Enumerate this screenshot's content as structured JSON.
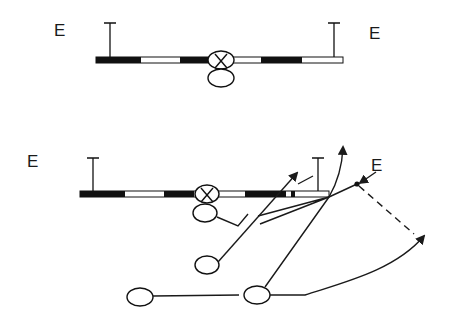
{
  "diagram": {
    "title": "",
    "formation_top": {
      "labels": [
        {
          "text": "E",
          "x": 54,
          "y": 24
        },
        {
          "text": "E",
          "x": 369,
          "y": 26
        }
      ],
      "line": {
        "x1": 96,
        "x2": 343,
        "y": 57,
        "h": 6,
        "segments": [
          {
            "fill": "#111111",
            "x": 96,
            "w": 45
          },
          {
            "fill": "#ffffff",
            "x": 141,
            "w": 39
          },
          {
            "fill": "#111111",
            "x": 180,
            "w": 30
          },
          {
            "fill": "#ffffff",
            "x": 235,
            "w": 26
          },
          {
            "fill": "#111111",
            "x": 261,
            "w": 41
          },
          {
            "fill": "#ffffff",
            "x": 302,
            "w": 41
          }
        ]
      },
      "tackles": [
        {
          "x": 110,
          "y_top": 23
        },
        {
          "x": 334,
          "y_top": 23
        }
      ],
      "center": {
        "label": "X",
        "cx": 221,
        "cy": 60,
        "rx": 13,
        "ry": 9
      },
      "qb": {
        "cx": 221,
        "cy": 78,
        "rx": 13,
        "ry": 9
      }
    },
    "formation_bottom": {
      "labels": [
        {
          "text": "E",
          "x": 27,
          "y": 154
        },
        {
          "text": "E",
          "x": 371,
          "y": 159
        }
      ],
      "line": {
        "x1": 80,
        "x2": 329,
        "y": 191,
        "h": 6,
        "segments": [
          {
            "fill": "#111111",
            "x": 80,
            "w": 45
          },
          {
            "fill": "#ffffff",
            "x": 125,
            "w": 39
          },
          {
            "fill": "#111111",
            "x": 164,
            "w": 30
          },
          {
            "fill": "#ffffff",
            "x": 219,
            "w": 26
          },
          {
            "fill": "#111111",
            "x": 245,
            "w": 41
          },
          {
            "fill": "#ffffff",
            "x": 286,
            "w": 43
          }
        ]
      },
      "tackles": [
        {
          "x": 93,
          "y_top": 158
        },
        {
          "x": 318,
          "y_top": 158
        }
      ],
      "center": {
        "label": "X",
        "cx": 207,
        "cy": 194,
        "rx": 12,
        "ry": 9
      },
      "backs": [
        {
          "name": "qb",
          "cx": 205,
          "cy": 213,
          "rx": 12,
          "ry": 9
        },
        {
          "name": "halfback",
          "cx": 207,
          "cy": 265,
          "rx": 12,
          "ry": 9
        },
        {
          "name": "fullback-left",
          "cx": 140,
          "cy": 297,
          "rx": 13,
          "ry": 9
        },
        {
          "name": "fullback-right",
          "cx": 257,
          "cy": 295,
          "rx": 13,
          "ry": 9
        }
      ],
      "end_dot": {
        "cx": 357,
        "cy": 184,
        "r": 2.5
      }
    }
  }
}
